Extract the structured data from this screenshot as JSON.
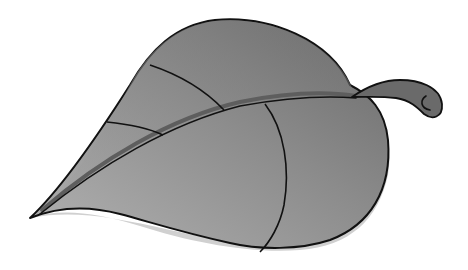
{
  "image": {
    "subject": "leaf illustration",
    "style": "grayscale vector clip-art",
    "colors": {
      "background": "#ffffff",
      "leaf_light": "#a6a6a6",
      "leaf_dark": "#6e6e6e",
      "edge_highlight": "#cfcfcf",
      "midrib_shadow": "#5e5e5e",
      "stem": "#6a6a6a",
      "outline": "#111111"
    },
    "elements": [
      "leaf-blade",
      "midrib",
      "veins",
      "stem",
      "underside-highlight"
    ]
  }
}
